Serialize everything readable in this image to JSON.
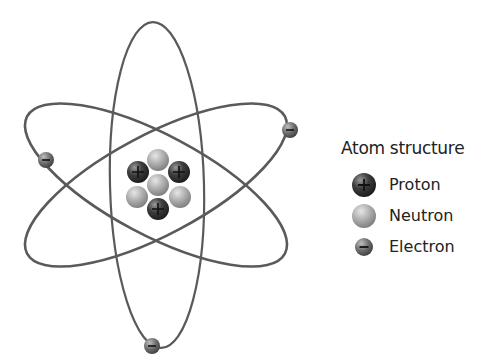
{
  "diagram": {
    "title": "Atom structure",
    "nucleus": {
      "protons": 3,
      "neutrons": 4,
      "particles": [
        {
          "type": "neutron",
          "x": 158,
          "y": 160
        },
        {
          "type": "proton",
          "x": 138,
          "y": 172
        },
        {
          "type": "proton",
          "x": 179,
          "y": 172
        },
        {
          "type": "neutron",
          "x": 158,
          "y": 185
        },
        {
          "type": "neutron",
          "x": 137,
          "y": 197
        },
        {
          "type": "neutron",
          "x": 180,
          "y": 197
        },
        {
          "type": "proton",
          "x": 158,
          "y": 209
        }
      ]
    },
    "electrons": [
      {
        "x": 46,
        "y": 160
      },
      {
        "x": 290,
        "y": 130
      },
      {
        "x": 152,
        "y": 346
      }
    ],
    "orbits": 3
  },
  "legend": {
    "title": "Atom structure",
    "items": [
      {
        "label": "Proton",
        "symbol": "plus",
        "icon": "proton-icon"
      },
      {
        "label": "Neutron",
        "symbol": "",
        "icon": "neutron-icon"
      },
      {
        "label": "Electron",
        "symbol": "minus",
        "icon": "electron-icon"
      }
    ]
  },
  "colors": {
    "background": "#ffffff",
    "orbit": "#5a5a5a",
    "proton": "#3a3a3a",
    "neutron": "#a8a8a8",
    "electron": "#6a6a6a",
    "text": "#222222"
  }
}
